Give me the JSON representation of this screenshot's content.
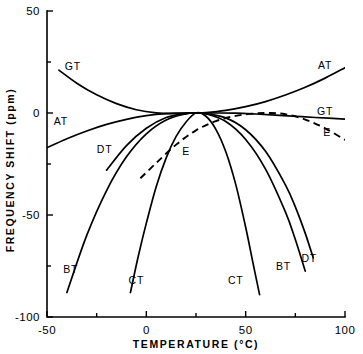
{
  "chart_data": {
    "type": "line",
    "title": "",
    "xlabel": "TEMPERATURE  (°C)",
    "ylabel": "FREQUENCY SHIFT  (ppm)",
    "xlim": [
      -50,
      100
    ],
    "ylim": [
      -100,
      50
    ],
    "xticks": [
      -50,
      0,
      50,
      100
    ],
    "xticklabels": [
      "-50",
      "0",
      "50",
      "100"
    ],
    "xminorticks": [
      -25,
      25,
      75
    ],
    "yticks": [
      50,
      0,
      -50,
      -100
    ],
    "yticklabels": [
      "50",
      "0",
      "-50",
      "-100"
    ],
    "yminorticks": [
      25,
      -25,
      -75
    ],
    "grid": false,
    "legend": "inline-curve-labels",
    "turnover_temperature": 25,
    "series": [
      {
        "name": "AT",
        "style": "solid",
        "labels": [
          "AT",
          "AT"
        ],
        "x": [
          -50,
          -40,
          -30,
          -20,
          -10,
          0,
          10,
          20,
          25,
          30,
          40,
          50,
          60,
          70,
          80,
          90,
          100
        ],
        "y": [
          -17.0,
          -12.6,
          -8.8,
          -5.6,
          -3.1,
          -1.3,
          -0.3,
          0.0,
          0.0,
          0.2,
          1.3,
          3.1,
          5.6,
          8.8,
          12.6,
          17.1,
          22.2
        ]
      },
      {
        "name": "GT",
        "style": "solid",
        "labels": [
          "GT",
          "GT"
        ],
        "x": [
          -44,
          -35,
          -25,
          -15,
          -5,
          5,
          15,
          25,
          35,
          45,
          55,
          65,
          75,
          85,
          100
        ],
        "y": [
          21.0,
          14.6,
          8.9,
          4.6,
          1.6,
          0.1,
          -0.2,
          0.0,
          0.0,
          -0.1,
          -0.5,
          -1.0,
          -1.6,
          -2.2,
          -3.0
        ]
      },
      {
        "name": "E",
        "style": "dashed",
        "labels": [
          "E",
          "E"
        ],
        "x": [
          -3,
          5,
          15,
          25,
          35,
          45,
          55,
          62,
          70,
          80,
          90,
          100
        ],
        "y": [
          -32.0,
          -24.5,
          -15.5,
          -8.5,
          -4.0,
          -1.4,
          -0.2,
          0.0,
          -0.6,
          -3.2,
          -7.5,
          -13.2
        ]
      },
      {
        "name": "DT",
        "style": "solid",
        "labels": [
          "DT",
          "DT"
        ],
        "x": [
          -20,
          -10,
          0,
          10,
          20,
          25,
          30,
          40,
          50,
          60,
          70,
          75,
          80,
          84
        ],
        "y": [
          -28.0,
          -16.0,
          -7.5,
          -2.2,
          -0.2,
          0.0,
          -0.2,
          -2.4,
          -8.2,
          -18.8,
          -35.2,
          -46.0,
          -59.0,
          -71.0
        ]
      },
      {
        "name": "BT",
        "style": "solid",
        "labels": [
          "BT",
          "BT"
        ],
        "x": [
          -40,
          -30,
          -20,
          -10,
          0,
          10,
          20,
          25,
          30,
          40,
          50,
          60,
          70,
          75,
          80
        ],
        "y": [
          -88.0,
          -60.0,
          -38.0,
          -21.5,
          -10.2,
          -3.4,
          -0.4,
          0.0,
          -0.4,
          -4.2,
          -13.0,
          -27.5,
          -48.5,
          -62.0,
          -77.5
        ]
      },
      {
        "name": "CT",
        "style": "solid",
        "labels": [
          "CT",
          "CT"
        ],
        "x": [
          -8,
          -4,
          0,
          5,
          10,
          15,
          20,
          25,
          30,
          35,
          40,
          45,
          50,
          54,
          57
        ],
        "y": [
          -88.0,
          -70.0,
          -54.0,
          -36.0,
          -22.0,
          -11.5,
          -4.4,
          0.0,
          -1.6,
          -8.0,
          -19.0,
          -35.0,
          -56.0,
          -75.0,
          -89.0
        ]
      }
    ],
    "curve_labels": [
      {
        "text": "GT",
        "x": -37,
        "y": 21.0
      },
      {
        "text": "AT",
        "x": -43,
        "y": -6.0
      },
      {
        "text": "DT",
        "x": -21,
        "y": -19.5
      },
      {
        "text": "BT",
        "x": -38,
        "y": -78.5
      },
      {
        "text": "CT",
        "x": -5,
        "y": -84.0
      },
      {
        "text": "E",
        "x": 20,
        "y": -20.5
      },
      {
        "text": "CT",
        "x": 45,
        "y": -84.0
      },
      {
        "text": "BT",
        "x": 69,
        "y": -77.0
      },
      {
        "text": "DT",
        "x": 82,
        "y": -73.0
      },
      {
        "text": "AT",
        "x": 90,
        "y": 21.5
      },
      {
        "text": "GT",
        "x": 90,
        "y": -1.0
      },
      {
        "text": "E",
        "x": 91,
        "y": -11.5
      }
    ]
  }
}
